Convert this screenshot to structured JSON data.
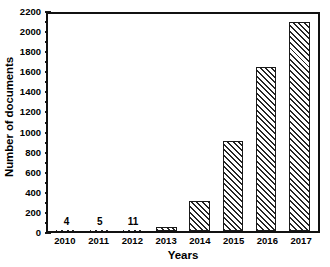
{
  "chart_data": {
    "type": "bar",
    "title": "",
    "xlabel": "Years",
    "ylabel": "Number of documents",
    "categories": [
      "2010",
      "2011",
      "2012",
      "2013",
      "2014",
      "2015",
      "2016",
      "2017"
    ],
    "values": [
      4,
      5,
      11,
      40,
      300,
      900,
      1630,
      2080
    ],
    "value_labels": [
      "4",
      "5",
      "11",
      "",
      "",
      "",
      "",
      ""
    ],
    "ylim": [
      0,
      2200
    ],
    "ytick_step": 200,
    "ytick_minor_step": 100,
    "ytick_labels": [
      "0",
      "200",
      "400",
      "600",
      "800",
      "1000",
      "1200",
      "1400",
      "1600",
      "1800",
      "2000",
      "2200"
    ],
    "grid": false,
    "legend": null,
    "legend_position": "none",
    "bar_fill": "diagonal-hatch",
    "bar_edge_color": "#1a1a1a",
    "hatch_color": "#262626",
    "background_color": "#ffffff",
    "frame": true
  }
}
